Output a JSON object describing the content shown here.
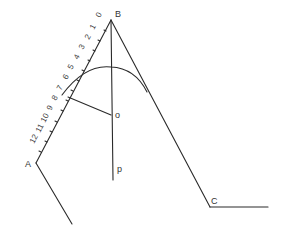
{
  "figure": {
    "points": {
      "A": "A",
      "B": "B",
      "C": "C",
      "O": "o",
      "P": "p"
    },
    "scale_labels": [
      "0",
      "1",
      "2",
      "3",
      "4",
      "5",
      "6",
      "7",
      "8",
      "9",
      "10",
      "11",
      "12"
    ]
  }
}
